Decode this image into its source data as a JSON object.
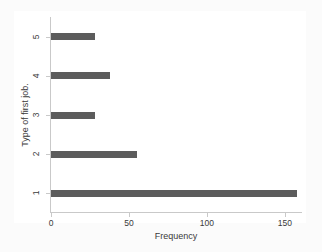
{
  "chart_data": {
    "type": "bar",
    "orientation": "horizontal",
    "title": "",
    "xlabel": "Frequency",
    "ylabel": "Type of first job.",
    "categories": [
      "1",
      "2",
      "3",
      "4",
      "5"
    ],
    "values": [
      158,
      55,
      28,
      38,
      28
    ],
    "xlim": [
      0,
      161
    ],
    "ylim": [
      0.5,
      5.5
    ],
    "xticks": [
      0,
      50,
      100,
      150
    ],
    "xtick_labels": [
      "0",
      "50",
      "100",
      "150"
    ],
    "yticks": [
      1,
      2,
      3,
      4,
      5
    ],
    "ytick_labels": [
      "1",
      "2",
      "3",
      "4",
      "5"
    ],
    "grid": false,
    "legend": false,
    "bar_color": "#5c5c5c",
    "axis_color": "#c9c9c9",
    "plot_background": "#ffffff",
    "figure_background": "#fbfbfb"
  }
}
